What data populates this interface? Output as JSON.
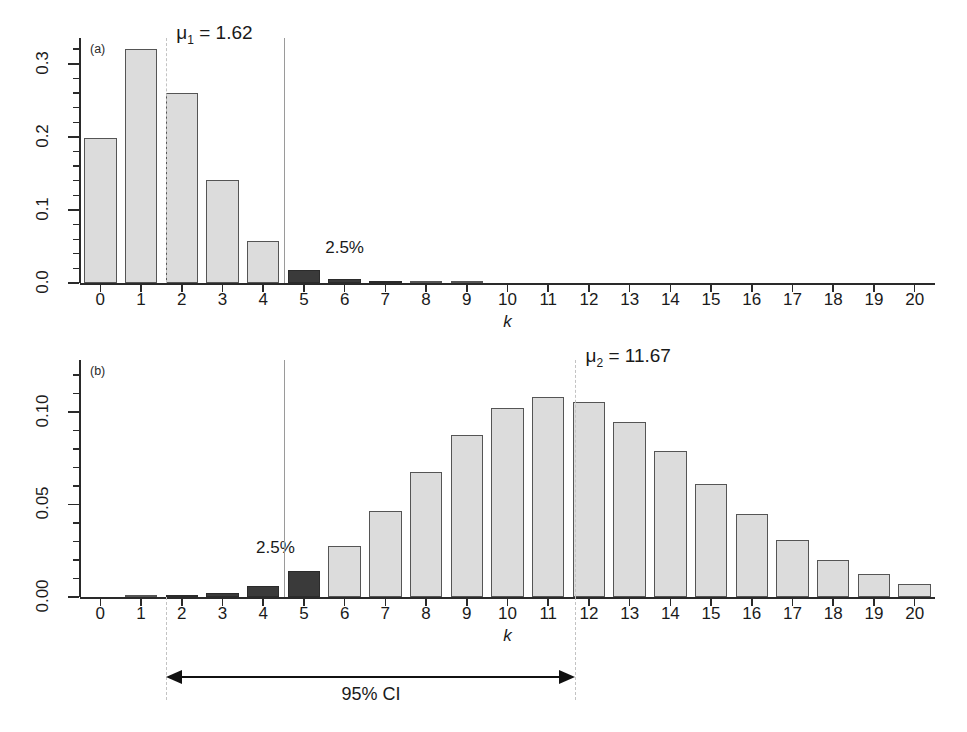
{
  "figure": {
    "ylabel_prefix": "P(",
    "ylabel_var": "X",
    "ylabel_mid": " = ",
    "ylabel_k": "k",
    "ylabel_suffix": ")",
    "xlabel": "k",
    "ci_label": "95% CI",
    "tail_label": "2.5%",
    "bar_light_color": "#dcdcdc",
    "bar_dark_color": "#3a3a3a",
    "dashed_line_color": "#c3c3c3",
    "solid_line_color": "#9a9a9a"
  },
  "panel_a": {
    "tag": "(a)",
    "mu_text": "μ",
    "mu_sub": "1",
    "mu_eq": " = 1.62",
    "tail_label": "2.5%",
    "ytick_labels": [
      "0.0",
      "0.1",
      "0.2",
      "0.3"
    ],
    "xtick_labels": [
      "0",
      "1",
      "2",
      "3",
      "4",
      "5",
      "6",
      "7",
      "8",
      "9",
      "10",
      "11",
      "12",
      "13",
      "14",
      "15",
      "16",
      "17",
      "18",
      "19",
      "20"
    ]
  },
  "panel_b": {
    "tag": "(b)",
    "mu_text": "μ",
    "mu_sub": "2",
    "mu_eq": " = 11.67",
    "tail_label": "2.5%",
    "ytick_labels": [
      "0.00",
      "0.05",
      "0.10"
    ],
    "xtick_labels": [
      "0",
      "1",
      "2",
      "3",
      "4",
      "5",
      "6",
      "7",
      "8",
      "9",
      "10",
      "11",
      "12",
      "13",
      "14",
      "15",
      "16",
      "17",
      "18",
      "19",
      "20"
    ]
  },
  "chart_data": [
    {
      "type": "bar",
      "panel": "(a)",
      "title": "",
      "xlabel": "k",
      "ylabel": "P(X = k)",
      "distribution": "Poisson",
      "mean": 1.62,
      "mean_label": "μ1 = 1.62",
      "categories": [
        0,
        1,
        2,
        3,
        4,
        5,
        6,
        7,
        8,
        9,
        10,
        11,
        12,
        13,
        14,
        15,
        16,
        17,
        18,
        19,
        20
      ],
      "values": [
        0.1979,
        0.3206,
        0.2597,
        0.1402,
        0.0568,
        0.0184,
        0.005,
        0.0011,
        0.0002,
        0.0001,
        0.0,
        0.0,
        0.0,
        0.0,
        0.0,
        0.0,
        0.0,
        0.0,
        0.0,
        0.0,
        0.0
      ],
      "highlighted_categories": [
        5,
        6,
        7
      ],
      "highlight_meaning": "2.5% upper tail",
      "annotations": [
        {
          "text": "2.5%",
          "x": 5.8,
          "y": 0.038
        },
        {
          "text": "μ1 = 1.62",
          "x": 1.62,
          "y": 0.33
        }
      ],
      "vlines": [
        {
          "x": 1.62,
          "style": "dashed",
          "color": "#c3c3c3"
        },
        {
          "x": 4.5,
          "style": "solid",
          "color": "#9a9a9a"
        }
      ],
      "ylim": [
        0,
        0.335
      ],
      "xlim": [
        -0.5,
        20.5
      ],
      "yticks": [
        0.0,
        0.1,
        0.2,
        0.3
      ],
      "ytick_labels": [
        "0.0",
        "0.1",
        "0.2",
        "0.3"
      ],
      "grid": false,
      "legend": "none"
    },
    {
      "type": "bar",
      "panel": "(b)",
      "title": "",
      "xlabel": "k",
      "ylabel": "P(X = k)",
      "distribution": "Poisson",
      "mean": 11.67,
      "mean_label": "μ2 = 11.67",
      "categories": [
        0,
        1,
        2,
        3,
        4,
        5,
        6,
        7,
        8,
        9,
        10,
        11,
        12,
        13,
        14,
        15,
        16,
        17,
        18,
        19,
        20
      ],
      "values": [
        0.0,
        0.0001,
        0.0005,
        0.0021,
        0.0061,
        0.0142,
        0.0277,
        0.0462,
        0.0674,
        0.0874,
        0.102,
        0.1082,
        0.1052,
        0.0944,
        0.0787,
        0.0612,
        0.0447,
        0.0307,
        0.0199,
        0.0122,
        0.0071
      ],
      "highlighted_categories": [
        2,
        3,
        4,
        5
      ],
      "highlight_meaning": "2.5% lower tail",
      "annotations": [
        {
          "text": "2.5%",
          "x": 4.2,
          "y": 0.03
        },
        {
          "text": "μ2 = 11.67",
          "x": 11.67,
          "y": 0.125
        }
      ],
      "vlines": [
        {
          "x": 11.67,
          "style": "dashed",
          "color": "#c3c3c3"
        },
        {
          "x": 4.5,
          "style": "solid",
          "color": "#9a9a9a"
        }
      ],
      "ylim": [
        0,
        0.128
      ],
      "xlim": [
        -0.5,
        20.5
      ],
      "yticks": [
        0.0,
        0.05,
        0.1
      ],
      "ytick_labels": [
        "0.00",
        "0.05",
        "0.10"
      ],
      "grid": false,
      "legend": "none"
    }
  ],
  "ci_annotation": {
    "label": "95% CI",
    "from_k": 1.62,
    "to_k": 11.67
  }
}
